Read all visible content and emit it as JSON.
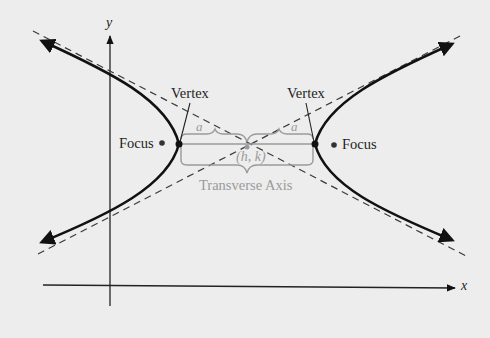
{
  "diagram": {
    "axes": {
      "x_label": "x",
      "y_label": "y"
    },
    "labels": {
      "vertex_left": "Vertex",
      "vertex_right": "Vertex",
      "focus_left": "Focus",
      "focus_right": "Focus",
      "a_left": "a",
      "a_right": "a",
      "center": "(h, k)",
      "transverse_axis": "Transverse Axis"
    },
    "colors": {
      "background": "#ededed",
      "curve": "#111111",
      "asymptote": "#3a3a3a",
      "annotation": "#9a9a9a"
    },
    "elements": [
      "hyperbola left branch (opens left, arrowheads at both ends)",
      "hyperbola right branch (opens right, arrowheads at both ends)",
      "two dashed asymptotes crossing at center (h, k)",
      "vertices marked as filled dots",
      "foci marked as filled dots outside vertices",
      "braces marking distance a from center to each vertex",
      "brace under transverse axis segment"
    ]
  }
}
